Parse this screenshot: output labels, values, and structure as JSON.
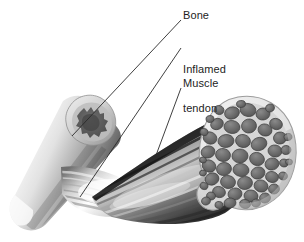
{
  "figure": {
    "name": "muscle-tendon-bone-cutaway-illustration",
    "background_color": "#ffffff",
    "style": "grayscale medical line-and-tone illustration",
    "width": 304,
    "height": 242
  },
  "labels": [
    {
      "id": "bone",
      "text": "Bone",
      "lines": [
        "Bone"
      ],
      "text_color": "#1d1d1d",
      "leader": {
        "from_x": 181,
        "from_y": 20,
        "to_x": 72,
        "to_y": 136
      }
    },
    {
      "id": "inflamed-tendon",
      "text": "Inflamed tendon",
      "lines": [
        "Inflamed",
        "tendon"
      ],
      "text_color": "#1d1d1d",
      "leader": {
        "from_x": 181,
        "from_y": 48,
        "to_x": 80,
        "to_y": 197
      }
    },
    {
      "id": "muscle",
      "text": "Muscle",
      "lines": [
        "Muscle"
      ],
      "text_color": "#1d1d1d",
      "leader": {
        "from_x": 181,
        "from_y": 88,
        "to_x": 155,
        "to_y": 158
      }
    }
  ],
  "structures": {
    "bone_shaft": {
      "name": "bone-shaft",
      "description": "long bone cylinder angled down-left, cut obliquely at upper right",
      "highlight_color": "#f2f2f2",
      "midtone_color": "#a9a9a9",
      "shadow_color": "#4a4a4a"
    },
    "bone_cut_end": {
      "name": "bone-cut-end-cross-section",
      "description": "oblique cut face showing pale cortical rim around scalloped dark marrow cavity",
      "cortex_color": "#cfcfcf",
      "marrow_color": "#5c5c5c"
    },
    "tendon": {
      "name": "inflamed-tendon",
      "description": "pale fibrous cord narrowing from muscle belly to bone insertion, swollen and bright",
      "fiber_color": "#ffffff",
      "shadow_color": "#5a5a5a"
    },
    "muscle_belly": {
      "name": "muscle-belly",
      "description": "striated muscle mass fanning up to the right toward the cut face",
      "light_color": "#e8e8e8",
      "dark_color": "#303030"
    },
    "muscle_cross_section": {
      "name": "muscle-cross-section",
      "description": "cut end of muscle showing many rounded fascicles inside a pale epimysium sheath",
      "sheath_color": "#e9e9e9",
      "perimysium_color": "#d2d2d2",
      "fascicle_color": "#6b6b6b",
      "fascicle_count": 52
    }
  }
}
